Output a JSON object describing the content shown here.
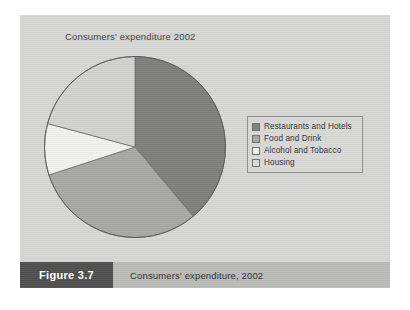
{
  "figure": {
    "number_label": "Figure 3.7",
    "caption": "Consumers' expenditure, 2002",
    "card_bg": "#d5d5d3",
    "caption_bar_bg": "#b9b9b7",
    "number_box_bg": "#4e4e4e"
  },
  "chart_data": {
    "type": "pie",
    "title": "Consumers' expenditure 2002",
    "xlabel": "",
    "ylabel": "",
    "legend_position": "right",
    "grid": false,
    "start_angle_deg": 0,
    "direction": "clockwise",
    "categories": [
      "Restaurants and Hotels",
      "Food and Drink",
      "Alcohol and Tobacco",
      "Housing"
    ],
    "values": [
      38.9,
      31.1,
      9.2,
      20.8
    ],
    "angles_deg": [
      140,
      112,
      33,
      75
    ],
    "colors": [
      "#7d7d7b",
      "#a6a6a4",
      "#efefed",
      "#d0d0ce"
    ],
    "slices": [
      {
        "label": "Restaurants and Hotels",
        "value": 38.9,
        "angle_deg": 140,
        "color": "#7d7d7b"
      },
      {
        "label": "Food and Drink",
        "value": 31.1,
        "angle_deg": 112,
        "color": "#a6a6a4"
      },
      {
        "label": "Alcohol and Tobacco",
        "value": 9.2,
        "angle_deg": 33,
        "color": "#efefed"
      },
      {
        "label": "Housing",
        "value": 20.8,
        "angle_deg": 75,
        "color": "#d0d0ce"
      }
    ]
  },
  "legend": {
    "items": [
      {
        "label": "Restaurants and Hotels",
        "color": "#7d7d7b"
      },
      {
        "label": "Food and Drink",
        "color": "#a6a6a4"
      },
      {
        "label": "Alcohol and Tobacco",
        "color": "#efefed"
      },
      {
        "label": "Housing",
        "color": "#d8d8d6"
      }
    ]
  }
}
